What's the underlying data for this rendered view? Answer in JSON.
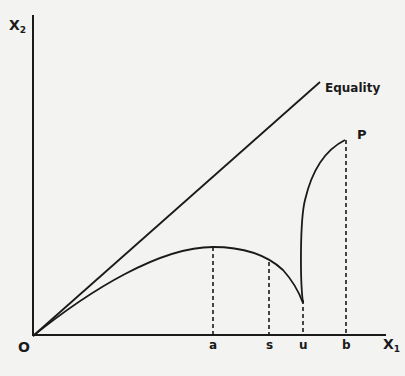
{
  "diagram": {
    "axes": {
      "y_label": "X",
      "y_sub": "2",
      "x_label": "X",
      "x_sub": "1",
      "origin_label": "O"
    },
    "line_label": "Equality",
    "point_label": "P",
    "ticks": [
      "a",
      "s",
      "u",
      "b"
    ],
    "colors": {
      "ink": "#1a1a1a",
      "paper": "#f3f3f1"
    }
  }
}
